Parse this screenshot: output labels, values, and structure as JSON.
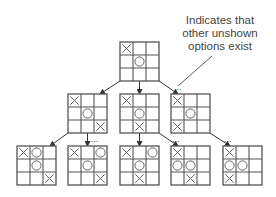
{
  "annotation": {
    "lines": [
      "Indicates that",
      "other unshown",
      "options exist"
    ]
  },
  "colors": {
    "grid": "#555555",
    "mark": "#666666",
    "arrow": "#333333",
    "text": "#444444"
  },
  "board_size": 39,
  "boards": [
    {
      "id": "root",
      "x": 120,
      "y": 42,
      "cells": [
        "X",
        "",
        "",
        "",
        "O",
        "",
        "",
        "",
        ""
      ]
    },
    {
      "id": "mid-1",
      "x": 68,
      "y": 94,
      "cells": [
        "X",
        "",
        "",
        "",
        "O",
        "",
        "",
        "",
        "X"
      ]
    },
    {
      "id": "mid-2",
      "x": 120,
      "y": 94,
      "cells": [
        "X",
        "",
        "",
        "",
        "O",
        "",
        "",
        "X",
        ""
      ]
    },
    {
      "id": "mid-3",
      "x": 171,
      "y": 94,
      "cells": [
        "X",
        "",
        "",
        "",
        "O",
        "",
        "X",
        "",
        ""
      ]
    },
    {
      "id": "leaf-1",
      "x": 17,
      "y": 146,
      "cells": [
        "X",
        "O",
        "",
        "",
        "O",
        "",
        "",
        "",
        "X"
      ]
    },
    {
      "id": "leaf-2",
      "x": 68,
      "y": 146,
      "cells": [
        "X",
        "",
        "O",
        "",
        "O",
        "",
        "",
        "",
        "X"
      ]
    },
    {
      "id": "leaf-3",
      "x": 120,
      "y": 146,
      "cells": [
        "X",
        "",
        "O",
        "",
        "O",
        "",
        "",
        "X",
        ""
      ]
    },
    {
      "id": "leaf-4",
      "x": 171,
      "y": 146,
      "cells": [
        "X",
        "",
        "",
        "O",
        "O",
        "",
        "",
        "X",
        ""
      ]
    },
    {
      "id": "leaf-5",
      "x": 223,
      "y": 146,
      "cells": [
        "X",
        "",
        "",
        "O",
        "O",
        "",
        "X",
        "",
        ""
      ]
    }
  ],
  "arrows": [
    {
      "x1": 120,
      "y1": 81,
      "x2": 100,
      "y2": 94
    },
    {
      "x1": 139.5,
      "y1": 81,
      "x2": 139.5,
      "y2": 94
    },
    {
      "x1": 159,
      "y1": 81,
      "x2": 178,
      "y2": 94
    },
    {
      "x1": 68,
      "y1": 133,
      "x2": 50,
      "y2": 146
    },
    {
      "x1": 87.5,
      "y1": 133,
      "x2": 87.5,
      "y2": 146
    },
    {
      "x1": 139.5,
      "y1": 133,
      "x2": 139.5,
      "y2": 146
    },
    {
      "x1": 159,
      "y1": 133,
      "x2": 178,
      "y2": 146
    },
    {
      "x1": 210,
      "y1": 133,
      "x2": 230,
      "y2": 146
    }
  ],
  "ellipses": [
    {
      "x": 174,
      "y": 90,
      "text": "..."
    },
    {
      "x": 91,
      "y": 142,
      "text": "..."
    },
    {
      "x": 172,
      "y": 142,
      "text": "..."
    },
    {
      "x": 224,
      "y": 142,
      "text": "..."
    }
  ],
  "leader_line": {
    "x1": 212,
    "y1": 56,
    "x2": 178,
    "y2": 86
  }
}
